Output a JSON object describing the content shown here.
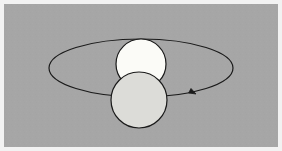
{
  "figure": {
    "title": "Orbital motion diagram",
    "canvas": {
      "width": 282,
      "height": 151,
      "background_color": "#a6a6a6",
      "border_color": "#f2f2f2",
      "border_width": 4
    },
    "elements": {
      "orbit": {
        "name": "orbit-ellipse",
        "shape": "ellipse",
        "center_x": 141,
        "center_y": 68,
        "radius_x": 92,
        "radius_y": 29,
        "stroke_color": "#1a1a1a",
        "stroke_width": 1.2,
        "fill": "none"
      },
      "direction_arrow": {
        "name": "direction-arrow",
        "shape": "triangle-marker",
        "tip_x": 196,
        "tip_y": 94,
        "size": 7,
        "angle_deg": 28,
        "color": "#1a1a1a",
        "meaning": "direction of orbital motion (clockwise as drawn)"
      },
      "upper_body": {
        "name": "white-sphere",
        "shape": "circle",
        "center_x": 141,
        "center_y": 64,
        "radius": 25,
        "fill_color": "#fbfbf7",
        "stroke_color": "#1a1a1a",
        "stroke_width": 1.2,
        "z_order": 1
      },
      "lower_body": {
        "name": "grey-sphere",
        "shape": "circle",
        "center_x": 139,
        "center_y": 100,
        "radius": 28,
        "fill_color": "#dcdcd8",
        "stroke_color": "#1a1a1a",
        "stroke_width": 1.2,
        "z_order": 2
      }
    },
    "labels": []
  }
}
